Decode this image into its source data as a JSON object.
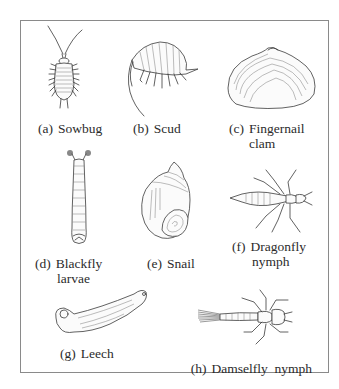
{
  "figure": {
    "panels": [
      {
        "id": "a",
        "tag": "(a)",
        "name": "Sowbug",
        "name_line2": "",
        "icon": "sowbug-illustration"
      },
      {
        "id": "b",
        "tag": "(b)",
        "name": "Scud",
        "name_line2": "",
        "icon": "scud-illustration"
      },
      {
        "id": "c",
        "tag": "(c)",
        "name": "Fingernail",
        "name_line2": "clam",
        "icon": "fingernail-clam-illustration"
      },
      {
        "id": "d",
        "tag": "(d)",
        "name": "Blackfly",
        "name_line2": "larvae",
        "icon": "blackfly-larvae-illustration"
      },
      {
        "id": "e",
        "tag": "(e)",
        "name": "Snail",
        "name_line2": "",
        "icon": "snail-illustration"
      },
      {
        "id": "f",
        "tag": "(f)",
        "name": "Dragonfly",
        "name_line2": "nymph",
        "icon": "dragonfly-nymph-illustration"
      },
      {
        "id": "g",
        "tag": "(g)",
        "name": "Leech",
        "name_line2": "",
        "icon": "leech-illustration"
      },
      {
        "id": "h",
        "tag": "(h)",
        "name": "Damselfly  nymph",
        "name_line2": "",
        "icon": "damselfly-nymph-illustration"
      }
    ],
    "colors": {
      "border": "#8a8a8a",
      "ink": "#3a3a3a",
      "background": "#ffffff"
    }
  }
}
